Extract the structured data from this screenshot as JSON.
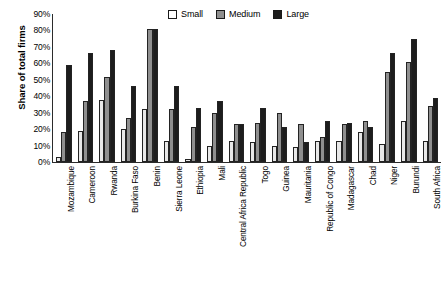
{
  "chart_data": {
    "type": "bar",
    "title": "",
    "xlabel": "",
    "ylabel": "Share of total firms",
    "ylim": [
      0,
      90
    ],
    "ytick_labels": [
      "90%",
      "80%",
      "70%",
      "60%",
      "50%",
      "40%",
      "30%",
      "20%",
      "10%",
      "0%"
    ],
    "ytick_values": [
      90,
      80,
      70,
      60,
      50,
      40,
      30,
      20,
      10,
      0
    ],
    "grid": false,
    "legend_position": "top-right",
    "categories": [
      "Mozambique",
      "Cameroon",
      "Rwanda",
      "Burkina Faso",
      "Benin",
      "Sierra Leone",
      "Ethiopia",
      "Mali",
      "Central Africa Republic",
      "Togo",
      "Guinea",
      "Mauritania",
      "Republic of Congo",
      "Madagascar",
      "Chad",
      "Niger",
      "Burundi",
      "South Africa"
    ],
    "series": [
      {
        "name": "Small",
        "color": "#e8e8e8",
        "values": [
          3,
          19,
          38,
          20,
          32,
          13,
          2,
          10,
          13,
          12,
          10,
          9,
          13,
          13,
          18,
          11,
          25,
          13
        ]
      },
      {
        "name": "Medium",
        "color": "#8f8f8f",
        "values": [
          18,
          37,
          52,
          27,
          81,
          32,
          21,
          30,
          23,
          24,
          30,
          23,
          15,
          23,
          25,
          55,
          61,
          34
        ]
      },
      {
        "name": "Large",
        "color": "#1d1d1d",
        "values": [
          59,
          66,
          68,
          46,
          81,
          46,
          33,
          37,
          23,
          33,
          21,
          12,
          25,
          24,
          21,
          66,
          75,
          39
        ]
      }
    ]
  },
  "legend": {
    "entries": [
      {
        "label": "Small"
      },
      {
        "label": "Medium"
      },
      {
        "label": "Large"
      }
    ]
  }
}
